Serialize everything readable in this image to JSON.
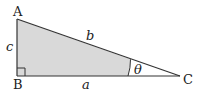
{
  "diagram": {
    "vertices": {
      "A": {
        "label": "A",
        "x": 17,
        "y": 19
      },
      "B": {
        "label": "B",
        "x": 17,
        "y": 76
      },
      "C": {
        "label": "C",
        "x": 180,
        "y": 76
      }
    },
    "sides": {
      "a": {
        "label": "a",
        "between": [
          "B",
          "C"
        ]
      },
      "b": {
        "label": "b",
        "between": [
          "A",
          "C"
        ]
      },
      "c": {
        "label": "c",
        "between": [
          "A",
          "B"
        ]
      }
    },
    "angle": {
      "label": "θ",
      "at": "C"
    },
    "right_angle_at": "B",
    "colors": {
      "fill": "#d9d9d9",
      "stroke": "#333333"
    }
  }
}
